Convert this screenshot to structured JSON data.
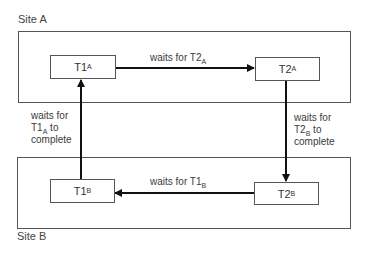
{
  "sites": [
    {
      "id": "site-a",
      "label": "Site A"
    },
    {
      "id": "site-b",
      "label": "Site B"
    }
  ],
  "nodes": {
    "t1a": {
      "main": "T1",
      "sub": "A"
    },
    "t2a": {
      "main": "T2",
      "sub": "A"
    },
    "t1b": {
      "main": "T1",
      "sub": "B"
    },
    "t2b": {
      "main": "T2",
      "sub": "B"
    }
  },
  "edges": {
    "t1a_to_t2a": {
      "prefix": "waits for ",
      "main": "T2",
      "sub": "A",
      "suffix": ""
    },
    "t2a_to_t2b": {
      "line1": "waits for",
      "main": "T2",
      "sub": "B",
      "suffix": " to",
      "line3": "complete"
    },
    "t2b_to_t1b": {
      "prefix": "waits for ",
      "main": "T1",
      "sub": "B",
      "suffix": ""
    },
    "t1b_to_t1a": {
      "line1": "waits for",
      "main": "T1",
      "sub": "A",
      "suffix": " to",
      "line3": "complete"
    }
  },
  "colors": {
    "line": "#111111",
    "border": "#555555",
    "text": "#3a3a3a"
  }
}
